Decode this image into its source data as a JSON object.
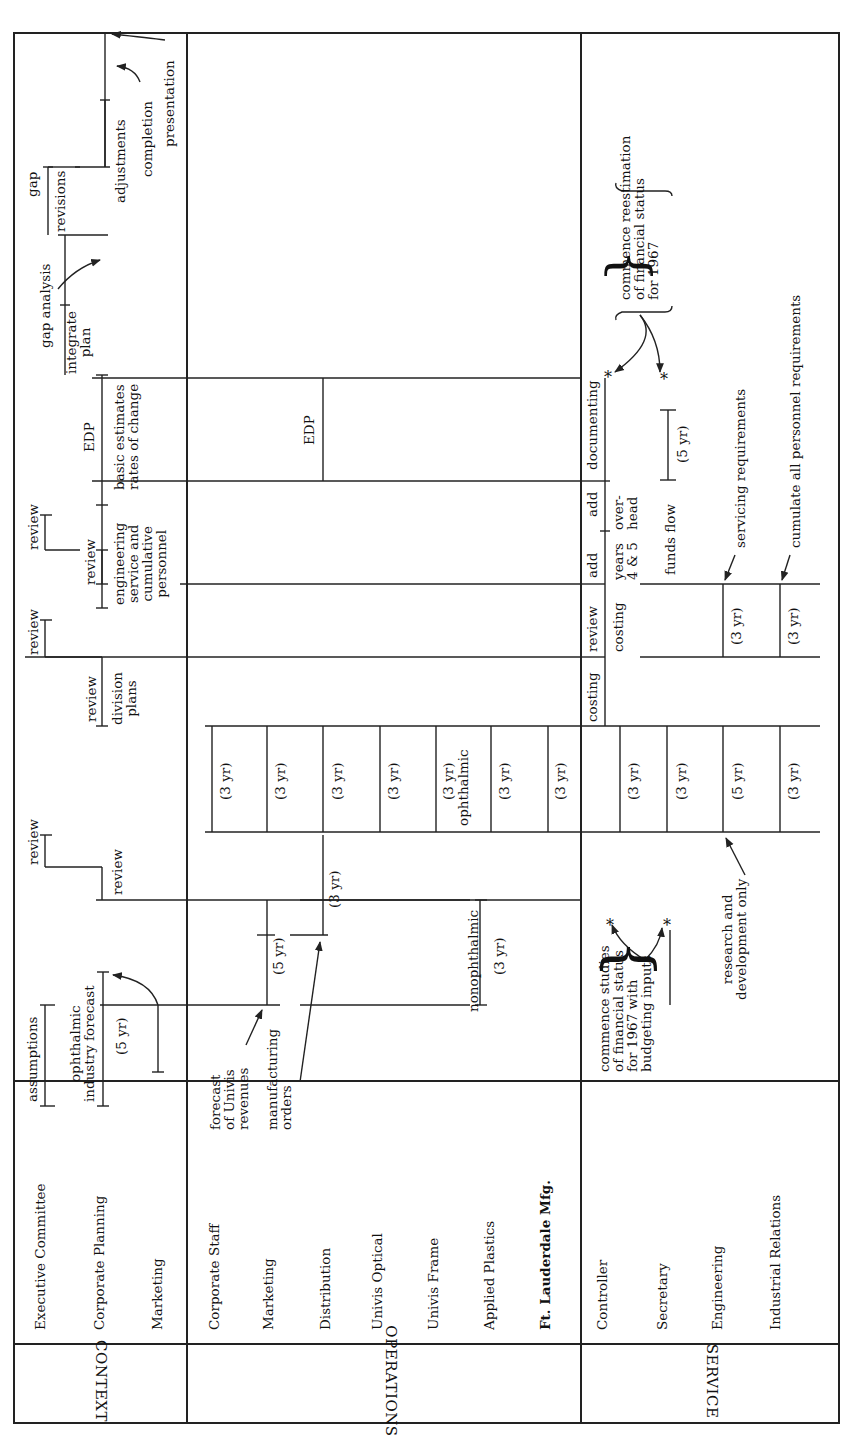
{
  "groups": [
    {
      "name": "CONTEXT",
      "rows": [
        "Executive Committee",
        "Corporate Planning",
        "Marketing"
      ]
    },
    {
      "name": "OPERATIONS",
      "rows": [
        "Corporate Staff",
        "Marketing",
        "Distribution",
        "Univis Optical",
        "Univis Frame",
        "Applied Plastics",
        "Ft. Lauderdale Mfg."
      ]
    },
    {
      "name": "SERVICE",
      "rows": [
        "Controller",
        "Secretary",
        "Engineering",
        "Industrial Relations"
      ]
    }
  ],
  "context": {
    "assumptions": "assumptions",
    "industry_forecast": "ophthalmic\nindustry forecast",
    "five_yr": "(5 yr)",
    "review_1a": "review",
    "review_1b": "review",
    "review_2a": "review",
    "review_2b": "review",
    "division_plans": "division\nplans",
    "review_3a": "review",
    "review_3b": "review",
    "engineering_service": "engineering\nservice and\ncumulative\npersonnel",
    "edp": "EDP",
    "basic_estimates": "basic estimates\nrates of change",
    "integrate_plan": "integrate\nplan",
    "gap_analysis": "gap analysis",
    "gap": "gap",
    "revisions": "revisions",
    "adjustments": "adjustments",
    "completion": "completion",
    "presentation": "presentation"
  },
  "operations": {
    "forecast_revenues": "forecast\nof Univis\nrevenues",
    "manufacturing_orders": "manufacturing\norders",
    "five_yr": "(5 yr)",
    "three_yr_distribution": "(3 yr)",
    "nonophthalmic": "nonophthalmic",
    "three_yr_nonophthalmic": "(3 yr)",
    "three_yr_cells": [
      "(3 yr)",
      "(3 yr)",
      "(3 yr)",
      "(3 yr)",
      "(3 yr)",
      "(3 yr)",
      "(3 yr)"
    ],
    "ophthalmic": "ophthalmic",
    "edp": "EDP"
  },
  "service": {
    "commence_studies": "commence studies\nof financial status\nfor 1967 with\nbudgeting inputs",
    "research_dev": "research and\ndevelopment only",
    "cells": [
      "(3 yr)",
      "(3 yr)",
      "(5 yr)",
      "(3 yr)"
    ],
    "costing_1": "costing",
    "review": "review",
    "costing_2": "costing",
    "add_1": "add",
    "years_4_5": "years\n4 & 5",
    "add_2": "add",
    "overhead": "over-\nhead",
    "funds_flow": "funds flow",
    "documenting": "documenting",
    "five_yr_funds": "(5 yr)",
    "servicing_req": "servicing requirements",
    "cumulate_req": "cumulate all personnel requirements",
    "three_yr_servicing": "(3 yr)",
    "three_yr_cumulate": "(3 yr)",
    "commence_reestimation": "commence reestimation\nof financial status\nfor 1967",
    "asterisk": "*"
  }
}
